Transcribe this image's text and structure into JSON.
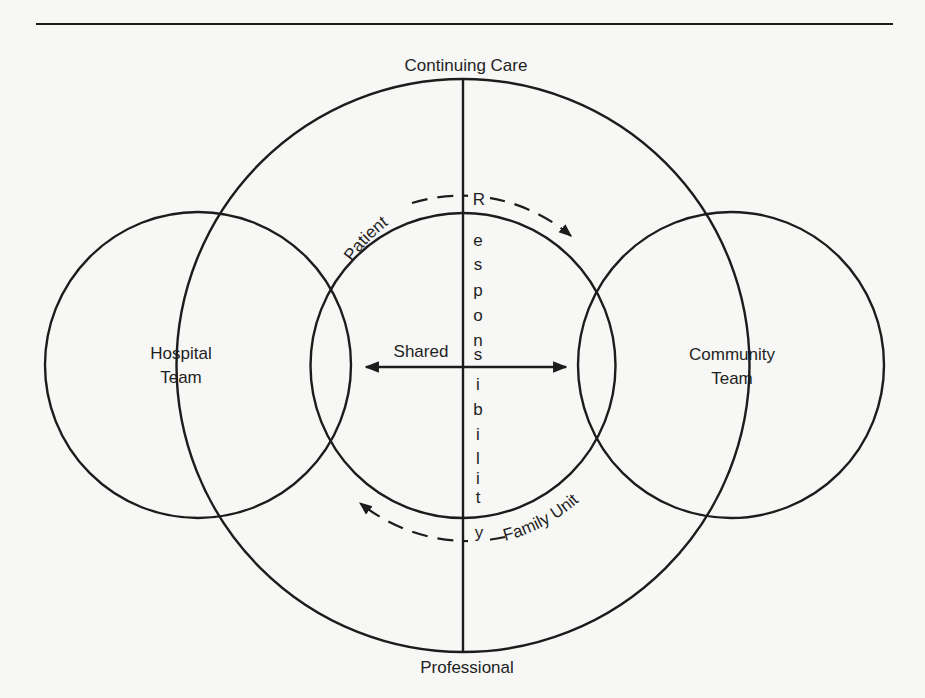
{
  "diagram": {
    "top_rule": true,
    "outer_circle": {
      "top_label": "Continuing Care",
      "bottom_label": "Professional"
    },
    "left_circle": {
      "label_line1": "Hospital",
      "label_line2": "Team"
    },
    "right_circle": {
      "label_line1": "Community",
      "label_line2": "Team"
    },
    "center": {
      "shared_label": "Shared",
      "vertical_word": "Responsibility",
      "vertical_letters": [
        "R",
        "e",
        "s",
        "p",
        "o",
        "n",
        "s",
        "i",
        "b",
        "i",
        "l",
        "i",
        "t",
        "y"
      ]
    },
    "arcs": {
      "top_arc_label": "Patient",
      "bottom_arc_label": "Family Unit"
    },
    "colors": {
      "background": "#f7f7f5",
      "ink": "#1c1c1c"
    }
  }
}
